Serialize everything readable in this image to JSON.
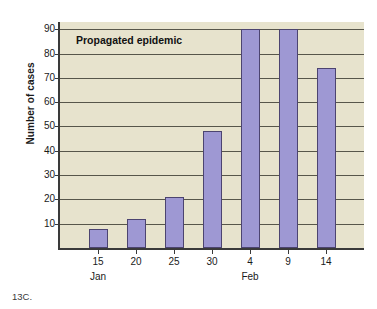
{
  "caption": "13C.",
  "colors": {
    "bar_fill": "#9e98d3",
    "bar_stroke": "#4c4470",
    "plot_background": "#e7e3cd",
    "axis": "#3a3a3a",
    "gridline": "#57564a",
    "page_background": "#ffffff",
    "text": "#1a1a1a"
  },
  "chart_data": {
    "type": "bar",
    "title": "Propagated epidemic",
    "xlabel": "",
    "ylabel": "Number of cases",
    "categories": [
      "15",
      "20",
      "25",
      "30",
      "4",
      "9",
      "14"
    ],
    "values": [
      8,
      12,
      21,
      48,
      90,
      90,
      74
    ],
    "month_groups": [
      {
        "label": "Jan",
        "category_index": 0
      },
      {
        "label": "Feb",
        "category_index": 4
      }
    ],
    "ylim": [
      0,
      93
    ],
    "yticks": [
      10,
      20,
      30,
      40,
      50,
      60,
      70,
      80,
      90
    ],
    "ytick_labels": [
      "10",
      "20",
      "30",
      "40",
      "50",
      "60",
      "70",
      "80",
      "90"
    ],
    "grid": true,
    "legend": "none"
  }
}
